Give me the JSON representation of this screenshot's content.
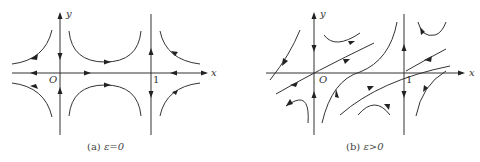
{
  "figure": {
    "panels": [
      {
        "id": "a",
        "label_x": "x",
        "label_y": "y",
        "label_origin": "O",
        "label_one": "1",
        "caption_prefix": "(a)",
        "caption_condition": "ε=0"
      },
      {
        "id": "b",
        "label_x": "x",
        "label_y": "y",
        "label_origin": "O",
        "label_one": "1",
        "caption_prefix": "(b)",
        "caption_condition": "ε>0"
      }
    ],
    "colors": {
      "stroke": "#333333",
      "background": "#ffffff"
    }
  }
}
